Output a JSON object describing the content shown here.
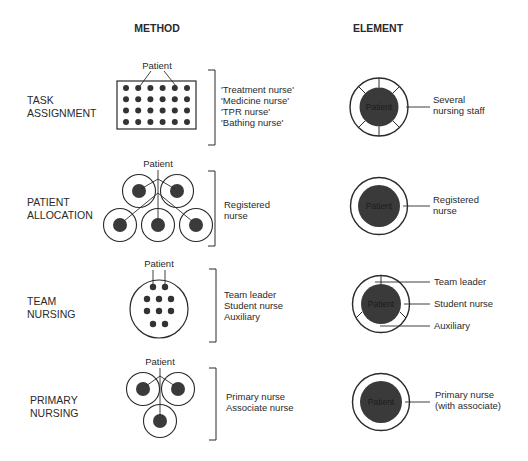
{
  "headers": {
    "method": "METHOD",
    "element": "ELEMENT"
  },
  "colors": {
    "ink": "#2a2a2a",
    "patient_fill": "#3a3a3a",
    "patient_label": "#1c1c1c",
    "background": "#ffffff"
  },
  "patient_label": "Patient",
  "rows": [
    {
      "id": "task-assignment",
      "label_lines": [
        "TASK",
        "ASSIGNMENT"
      ],
      "method_patient_label": "Patient",
      "method_staff_lines": [
        "'Treatment nurse'",
        "'Medicine nurse'",
        "'TPR nurse'",
        "'Bathing nurse'"
      ],
      "element_center_label": "Patient",
      "element_callouts": [
        {
          "lines": [
            "Several",
            "nursing staff"
          ]
        }
      ]
    },
    {
      "id": "patient-allocation",
      "label_lines": [
        "PATIENT",
        "ALLOCATION"
      ],
      "method_patient_label": "Patient",
      "method_staff_lines": [
        "Registered",
        "nurse"
      ],
      "element_center_label": "Patient",
      "element_callouts": [
        {
          "lines": [
            "Registered",
            "nurse"
          ]
        }
      ]
    },
    {
      "id": "team-nursing",
      "label_lines": [
        "TEAM",
        "NURSING"
      ],
      "method_patient_label": "Patient",
      "method_staff_lines": [
        "Team leader",
        "Student nurse",
        "Auxiliary"
      ],
      "element_center_label": "Patient",
      "element_callouts": [
        {
          "lines": [
            "Team leader"
          ]
        },
        {
          "lines": [
            "Student nurse"
          ]
        },
        {
          "lines": [
            "Auxiliary"
          ]
        }
      ]
    },
    {
      "id": "primary-nursing",
      "label_lines": [
        "PRIMARY",
        "NURSING"
      ],
      "method_patient_label": "Patient",
      "method_staff_lines": [
        "Primary nurse",
        "Associate nurse"
      ],
      "element_center_label": "Patient",
      "element_callouts": [
        {
          "lines": [
            "Primary nurse",
            "(with associate)"
          ]
        }
      ]
    }
  ]
}
